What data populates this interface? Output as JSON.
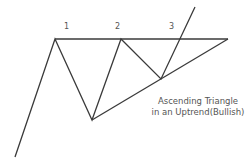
{
  "diagram": {
    "title_fragment": "",
    "labels": [
      "1",
      "2",
      "3"
    ],
    "caption_line1": "Ascending Triangle",
    "caption_line2": "in an Uptrend(Bullish)",
    "line_color": "#3a3a3a",
    "text_color": "#555555"
  }
}
